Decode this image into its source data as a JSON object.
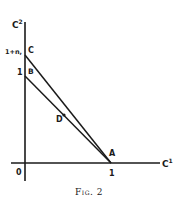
{
  "figure": {
    "caption": "Fig. 2",
    "axes": {
      "x_label": "C",
      "x_label_sup": "1",
      "y_label": "C",
      "y_label_sup": "2",
      "origin_label": "0",
      "x_tick_label": "1",
      "y_tick_label": "1",
      "y_tick2_label": "1+n,"
    },
    "points": {
      "A": "A",
      "B": "B",
      "C": "C",
      "D": "D"
    },
    "colors": {
      "ink": "#1a1a1a",
      "background": "#ffffff"
    }
  }
}
